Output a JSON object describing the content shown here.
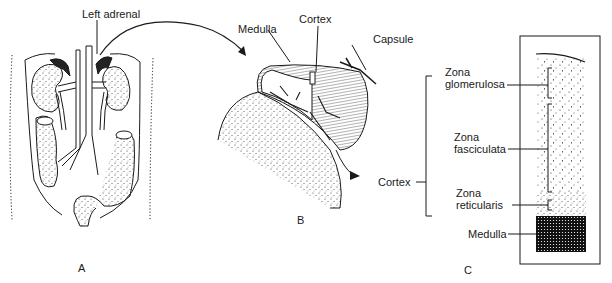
{
  "figure": {
    "panels": [
      {
        "id": "A",
        "label": "A",
        "description": "Abdominal organs showing kidneys, adrenal glands, aorta, vena cava and colon"
      },
      {
        "id": "B",
        "label": "B",
        "description": "Enlarged adrenal gland seated on kidney pole"
      },
      {
        "id": "C",
        "label": "C",
        "description": "Histological section through adrenal cortex and medulla"
      }
    ],
    "labels": {
      "left_adrenal": "Left adrenal",
      "b_medulla": "Medulla",
      "b_cortex": "Cortex",
      "b_capsule": "Capsule",
      "c_cortex": "Cortex",
      "zona_glomerulosa_1": "Zona",
      "zona_glomerulosa_2": "glomerulosa",
      "zona_fasciculata_1": "Zona",
      "zona_fasciculata_2": "fasciculata",
      "zona_reticularis_1": "Zona",
      "zona_reticularis_2": "reticularis",
      "c_medulla": "Medulla"
    },
    "colors": {
      "ink": "#1a1a1a",
      "background": "#ffffff"
    }
  }
}
